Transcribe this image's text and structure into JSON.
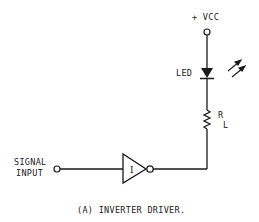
{
  "diagram": {
    "type": "circuit-schematic",
    "caption": "(A) INVERTER DRIVER.",
    "labels": {
      "vcc": "+ VCC",
      "led": "LED",
      "resistor_r": "R",
      "resistor_sub": "L",
      "signal_line1": "SIGNAL",
      "signal_line2": "INPUT",
      "inverter": "I"
    },
    "components": [
      {
        "id": "vcc-terminal",
        "kind": "terminal",
        "label": "+ VCC"
      },
      {
        "id": "led",
        "kind": "light-emitting-diode",
        "label": "LED"
      },
      {
        "id": "load-resistor",
        "kind": "resistor",
        "label": "RL"
      },
      {
        "id": "inverter",
        "kind": "inverter-gate",
        "label": "I"
      },
      {
        "id": "signal-input-terminal",
        "kind": "terminal",
        "label": "SIGNAL INPUT"
      }
    ],
    "colors": {
      "ink": "#1a1a1a",
      "background": "#ffffff"
    }
  }
}
